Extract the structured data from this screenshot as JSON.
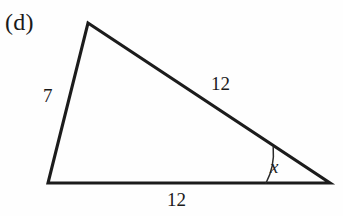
{
  "figure": {
    "part_label": "(d)",
    "shape": "triangle",
    "stroke_color": "#1c1c1c",
    "background_color": "#fefefe",
    "vertices": {
      "apex": {
        "x": 88,
        "y": 23
      },
      "bottom_left": {
        "x": 48,
        "y": 183
      },
      "bottom_right": {
        "x": 330,
        "y": 183
      }
    },
    "sides": [
      {
        "name": "left-side",
        "label": "7",
        "from": "apex",
        "to": "bottom_left"
      },
      {
        "name": "hypotenuse",
        "label": "12",
        "from": "apex",
        "to": "bottom_right"
      },
      {
        "name": "base",
        "label": "12",
        "from": "bottom_left",
        "to": "bottom_right"
      }
    ],
    "angle_marker": {
      "label": "x",
      "at_vertex": "bottom_right",
      "arc_radius": 64,
      "style": "single-arc"
    }
  }
}
